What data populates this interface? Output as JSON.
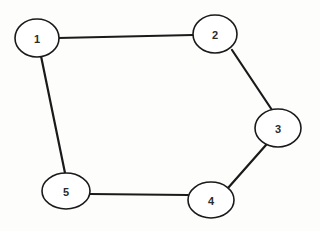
{
  "diagram": {
    "type": "node-link-graph",
    "background_color": "#fdfdfc",
    "width": 320,
    "height": 231,
    "node_style": {
      "fill": "#ffffff",
      "stroke": "#1a1a1a",
      "stroke_width": 1.6,
      "label_color": "#2b2b2b",
      "label_font_size": 11,
      "label_font_weight": "bold"
    },
    "edge_style": {
      "stroke": "#1a1a1a",
      "stroke_width": 2.2
    },
    "nodes": [
      {
        "id": "1",
        "label": "1",
        "cx": 37,
        "cy": 38,
        "rx": 22,
        "ry": 19
      },
      {
        "id": "2",
        "label": "2",
        "cx": 215,
        "cy": 34,
        "rx": 22,
        "ry": 19
      },
      {
        "id": "3",
        "label": "3",
        "cx": 278,
        "cy": 128,
        "rx": 23,
        "ry": 19
      },
      {
        "id": "4",
        "label": "4",
        "cx": 211,
        "cy": 200,
        "rx": 23,
        "ry": 18
      },
      {
        "id": "5",
        "label": "5",
        "cx": 66,
        "cy": 191,
        "rx": 24,
        "ry": 18
      }
    ],
    "edges": [
      {
        "id": "edge-1-2",
        "source": "1",
        "target": "2",
        "x1": 58,
        "y1": 38,
        "x2": 193,
        "y2": 35
      },
      {
        "id": "edge-2-3",
        "source": "2",
        "target": "3",
        "x1": 232,
        "y1": 50,
        "x2": 272,
        "y2": 110
      },
      {
        "id": "edge-3-4",
        "source": "3",
        "target": "4",
        "x1": 266,
        "y1": 145,
        "x2": 228,
        "y2": 188
      },
      {
        "id": "edge-4-5",
        "source": "4",
        "target": "5",
        "x1": 188,
        "y1": 195,
        "x2": 90,
        "y2": 194
      },
      {
        "id": "edge-5-1",
        "source": "5",
        "target": "1",
        "x1": 65,
        "y1": 173,
        "x2": 41,
        "y2": 56
      }
    ]
  }
}
